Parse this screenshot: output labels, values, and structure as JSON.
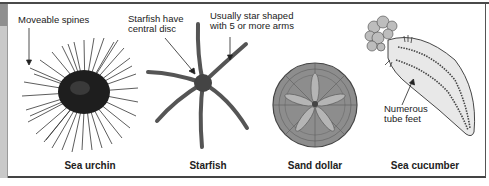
{
  "diagram": {
    "organisms": [
      {
        "name": "Sea urchin",
        "caption": "Sea urchin"
      },
      {
        "name": "Starfish",
        "caption": "Starfish"
      },
      {
        "name": "Sand dollar",
        "caption": "Sand dollar"
      },
      {
        "name": "Sea cucumber",
        "caption": "Sea cucumber"
      }
    ],
    "annotations": {
      "urchin_spines": "Moveable spines",
      "starfish_disc_line1": "Starfish have",
      "starfish_disc_line2": "central disc",
      "starfish_arms_line1": "Usually star shaped",
      "starfish_arms_line2": "with 5 or more arms",
      "cucumber_feet_line1": "Numerous",
      "cucumber_feet_line2": "tube feet"
    },
    "colors": {
      "frame": "#4a4a4a",
      "side_strip_light": "#c9c9c9",
      "side_strip_dark": "#8f8f8f",
      "ink": "#222222",
      "background": "#ffffff"
    }
  }
}
